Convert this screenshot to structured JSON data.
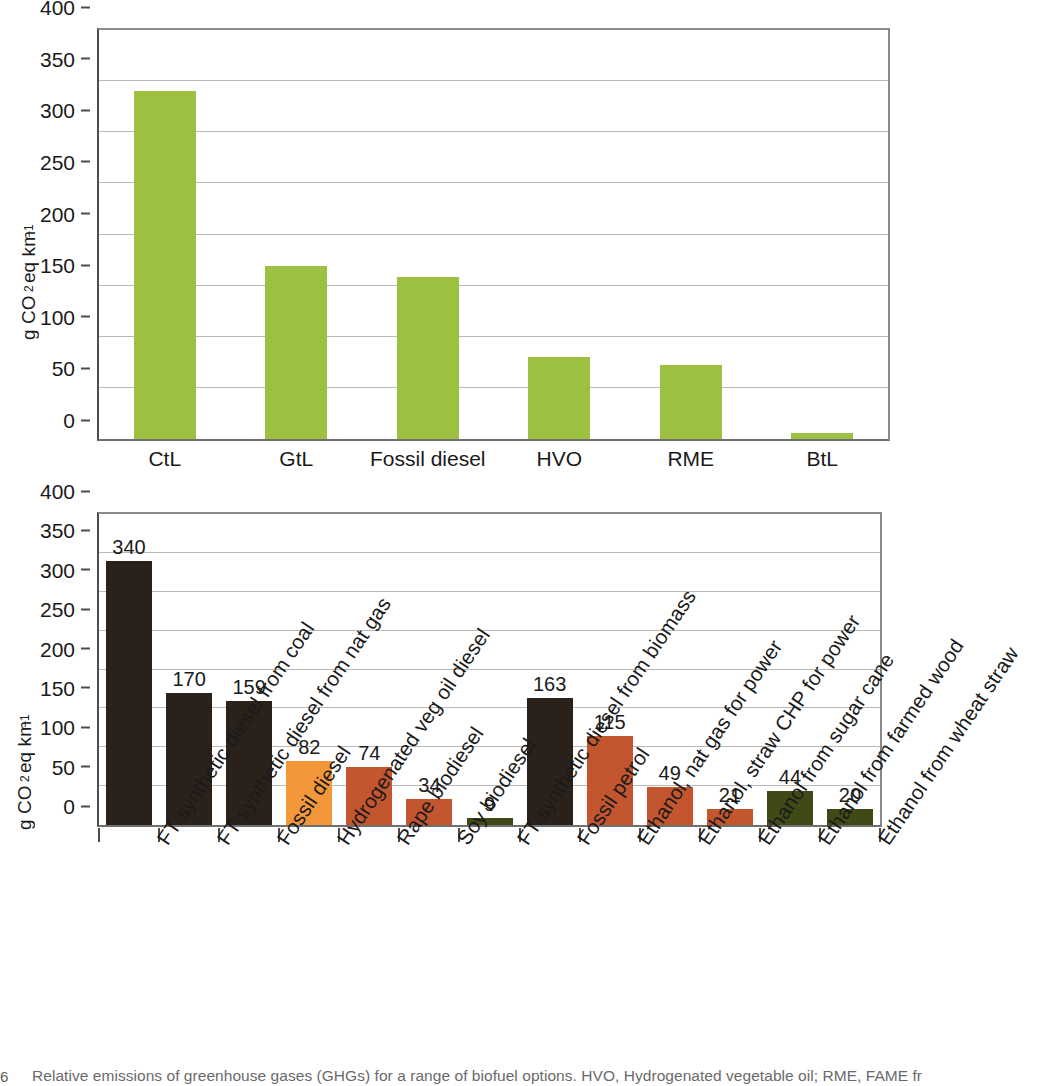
{
  "figure": {
    "caption_marker": "6",
    "caption": "Relative emissions of greenhouse gases (GHGs) for a range of biofuel options. HVO, Hydrogenated vegetable oil; RME, FAME fr",
    "background": "#ffffff"
  },
  "palette": {
    "green_light": "#9CC03F",
    "dark_brown": "#2B211B",
    "orange": "#F3973B",
    "orange_red": "#C4562F",
    "olive": "#3F4A17",
    "axis": "#4d4d4d",
    "grid": "#b9b9b9"
  },
  "chart_data": [
    {
      "id": "top",
      "type": "bar",
      "title": "",
      "xlabel": "",
      "ylabel": "g CO2 eq km-1",
      "ylabel_parts": {
        "prefix": "g CO",
        "sub": "2",
        "mid": " eq km",
        "sup": "−1"
      },
      "ylim": [
        0,
        400
      ],
      "yticks": [
        0,
        50,
        100,
        150,
        200,
        250,
        300,
        350,
        400
      ],
      "ytick_labels": [
        "0",
        "50",
        "100",
        "150",
        "200",
        "250",
        "300",
        "350",
        "400"
      ],
      "grid": true,
      "show_value_labels": false,
      "legend": "none",
      "categories": [
        "CtL",
        "GtL",
        "Fossil diesel",
        "HVO",
        "RME",
        "BtL"
      ],
      "values": [
        340,
        169,
        158,
        80,
        72,
        6
      ],
      "colors": [
        "#9CC03F",
        "#9CC03F",
        "#9CC03F",
        "#9CC03F",
        "#9CC03F",
        "#9CC03F"
      ]
    },
    {
      "id": "bottom",
      "type": "bar",
      "title": "",
      "xlabel": "",
      "ylabel": "g CO2 eq km-1",
      "ylabel_parts": {
        "prefix": "g CO",
        "sub": "2",
        "mid": " eq km",
        "sup": "−1"
      },
      "ylim": [
        0,
        400
      ],
      "yticks": [
        0,
        50,
        100,
        150,
        200,
        250,
        300,
        350,
        400
      ],
      "ytick_labels": [
        "0",
        "50",
        "100",
        "150",
        "200",
        "250",
        "300",
        "350",
        "400"
      ],
      "grid": true,
      "show_value_labels": true,
      "legend": "none",
      "categories": [
        "FT synthetic diesel from coal",
        "FT synthetic diesel from nat gas",
        "Fossil diesel",
        "Hydrogenated veg oil diesel",
        "Rape biodiesel",
        "Soy biodiesel",
        "FT synthetic diesel from biomass",
        "Fossil petrol",
        "Ethanol, nat gas for power",
        "Ethanol, straw CHP for power",
        "Ethanol from sugar cane",
        "Ethanol from farmed wood",
        "Ethanol from wheat straw"
      ],
      "values": [
        340,
        170,
        159,
        82,
        74,
        34,
        9,
        163,
        115,
        49,
        21,
        44,
        20
      ],
      "value_labels": [
        "340",
        "170",
        "159",
        "82",
        "74",
        "34",
        "9",
        "163",
        "115",
        "49",
        "21",
        "44",
        "20"
      ],
      "colors": [
        "#2B211B",
        "#2B211B",
        "#2B211B",
        "#F3973B",
        "#C4562F",
        "#C4562F",
        "#3F4A17",
        "#2B211B",
        "#C4562F",
        "#C4562F",
        "#C4562F",
        "#3F4A17",
        "#3F4A17"
      ]
    }
  ]
}
